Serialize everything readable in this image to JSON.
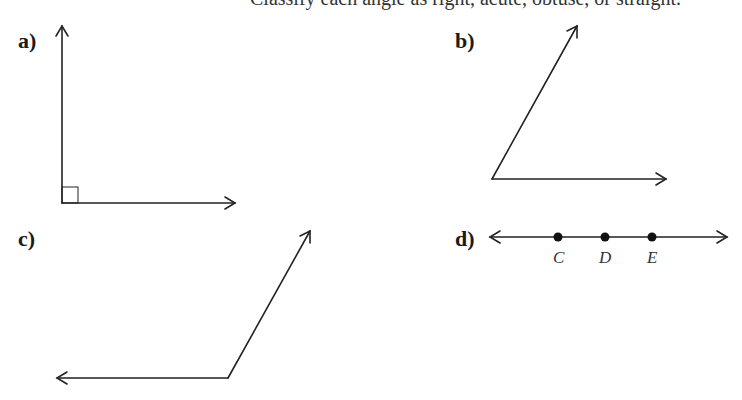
{
  "header": {
    "clipped_text": "Classify each angle as right, acute, obtuse, or straight."
  },
  "problems": [
    {
      "label": "a)",
      "type": "right-angle"
    },
    {
      "label": "b)",
      "type": "acute-angle"
    },
    {
      "label": "c)",
      "type": "obtuse-angle"
    },
    {
      "label": "d)",
      "type": "straight-angle",
      "points": [
        "C",
        "D",
        "E"
      ]
    }
  ]
}
